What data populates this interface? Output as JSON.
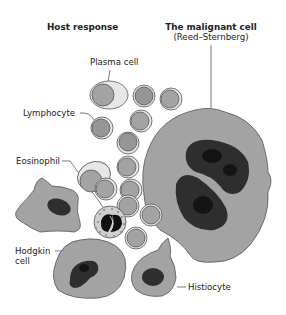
{
  "headers": {
    "host_response": "Host response",
    "malignant_cell_title": "The malignant cell",
    "malignant_cell_subtitle": "(Reed–Sternberg)"
  },
  "labels": {
    "plasma_cell": "Plasma cell",
    "lymphocyte": "Lymphocyte",
    "eosinophil": "Eosinophil",
    "hodgkin_cell_line1": "Hodgkin",
    "hodgkin_cell_line2": "cell",
    "histiocyte": "Histiocyte"
  },
  "colors": {
    "cytoplasm": "#a3a3a3",
    "light_cytoplasm": "#e6e6e6",
    "nucleus_dark": "#2e2e2e",
    "nucleolus": "#141414",
    "outline": "#555555",
    "text": "#222222"
  }
}
